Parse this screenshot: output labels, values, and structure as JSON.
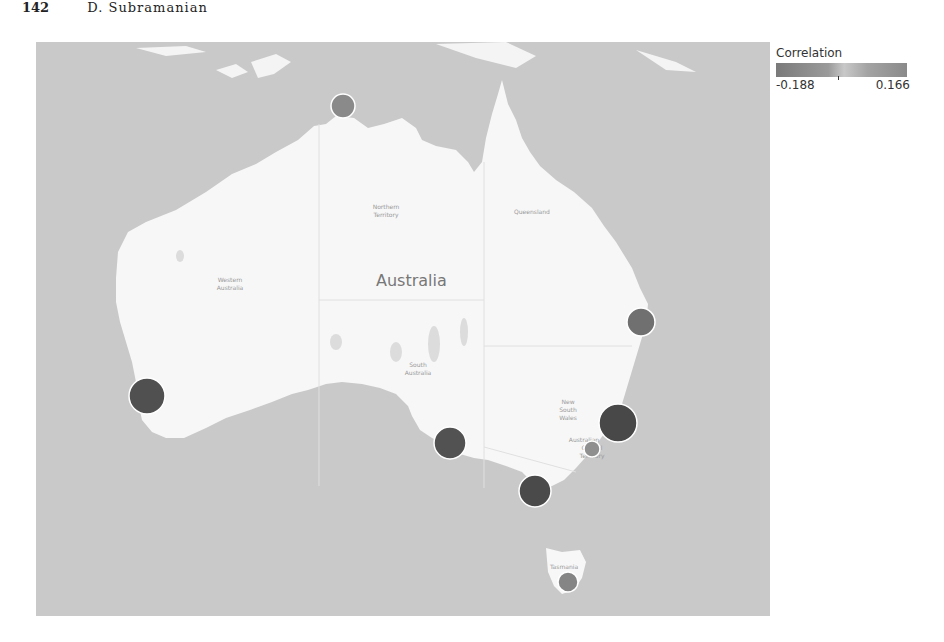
{
  "header": {
    "page_number": "142",
    "author": "D. Subramanian"
  },
  "map": {
    "country_label": "Australia",
    "region_labels": [
      {
        "name": "Northern Territory",
        "x": 350,
        "y": 167
      },
      {
        "name": "Queensland",
        "x": 496,
        "y": 172
      },
      {
        "name": "Western Australia",
        "x": 194,
        "y": 240
      },
      {
        "name": "South Australia",
        "x": 382,
        "y": 325
      },
      {
        "name": "New South Wales",
        "x": 532,
        "y": 362
      },
      {
        "name": "Australian Capital Territory",
        "x": 556,
        "y": 404
      },
      {
        "name": "Tasmania",
        "x": 536,
        "y": 527
      }
    ],
    "colors": {
      "sea": "#c9c9c9",
      "land": "#f7f7f7",
      "border": "#dddddd",
      "marker_stroke": "#ffffff"
    }
  },
  "legend": {
    "title": "Correlation",
    "min_label": "-0.188",
    "max_label": "0.166"
  },
  "markers": [
    {
      "name": "darwin",
      "cx": 307,
      "cy": 64,
      "r": 12,
      "color": "#8a8a8a"
    },
    {
      "name": "brisbane",
      "cx": 605,
      "cy": 280,
      "r": 14,
      "color": "#707070"
    },
    {
      "name": "perth",
      "cx": 111,
      "cy": 354,
      "r": 18,
      "color": "#505050"
    },
    {
      "name": "sydney",
      "cx": 582,
      "cy": 381,
      "r": 19,
      "color": "#484848"
    },
    {
      "name": "adelaide",
      "cx": 414,
      "cy": 401,
      "r": 16,
      "color": "#525252"
    },
    {
      "name": "canberra",
      "cx": 556,
      "cy": 407,
      "r": 8,
      "color": "#8f8f8f"
    },
    {
      "name": "melbourne",
      "cx": 499,
      "cy": 449,
      "r": 16,
      "color": "#4a4a4a"
    },
    {
      "name": "hobart",
      "cx": 532,
      "cy": 540,
      "r": 10,
      "color": "#858585"
    }
  ]
}
